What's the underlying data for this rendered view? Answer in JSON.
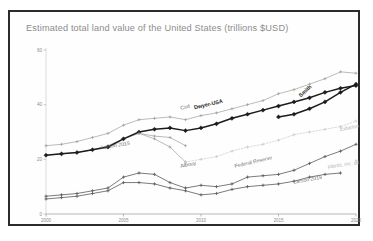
{
  "chart_data": {
    "type": "line",
    "title": "Estimated total land value of the United States (trillions $USD)",
    "xlabel": "",
    "ylabel": "",
    "xlim": [
      2000,
      2020
    ],
    "ylim": [
      0,
      60
    ],
    "xticks": [
      "2000",
      "2005",
      "2010",
      "2015",
      "2020"
    ],
    "yticks": [
      "0",
      "20",
      "40",
      "60"
    ],
    "grid": false,
    "legend_position": "inline-annotations",
    "series": [
      {
        "name": "Cird",
        "style": "thin-grey",
        "label_x": 2009,
        "label_y": 38.5,
        "x": [
          2000,
          2001,
          2002,
          2003,
          2004,
          2005,
          2006,
          2007,
          2008,
          2009,
          2010,
          2011,
          2012,
          2013,
          2014,
          2015,
          2016,
          2017,
          2018,
          2019,
          2020
        ],
        "values": [
          25,
          25.5,
          26.5,
          28,
          29.5,
          32.5,
          34.5,
          35,
          35.5,
          34.5,
          36,
          37,
          38.5,
          40,
          41.5,
          44,
          45.5,
          47.5,
          49.5,
          52,
          51.5
        ]
      },
      {
        "name": "Larson 2015",
        "style": "thin-grey",
        "label_x": 2004.5,
        "label_y": 24.5,
        "x": [
          2000,
          2001,
          2002,
          2003,
          2004,
          2005,
          2006,
          2007,
          2008,
          2009
        ],
        "values": [
          21.5,
          22,
          22.5,
          23.5,
          25,
          27.5,
          29.5,
          28.5,
          28,
          25
        ]
      },
      {
        "name": "Dwyer-USA",
        "style": "bold-black",
        "label_x": 2010.5,
        "label_y": 39.5,
        "x": [
          2000,
          2001,
          2002,
          2003,
          2004,
          2005,
          2006,
          2007,
          2008,
          2009,
          2010,
          2011,
          2012,
          2013,
          2014,
          2015,
          2016,
          2017,
          2018,
          2019,
          2020
        ],
        "values": [
          21.5,
          22,
          22.5,
          23.5,
          24.5,
          27.5,
          30,
          31,
          31.5,
          30.5,
          31.5,
          33,
          35,
          36.5,
          38,
          39.5,
          41,
          42.5,
          44.5,
          46,
          47
        ]
      },
      {
        "name": "Smith",
        "style": "bold-black",
        "label_x": 2016.8,
        "label_y": 44.5,
        "x": [
          2015,
          2016,
          2017,
          2018,
          2019,
          2020
        ],
        "values": [
          35.5,
          36.5,
          38.5,
          41,
          44.5,
          47.5
        ]
      },
      {
        "name": "Albouy",
        "style": "thin-grey",
        "label_x": 2009.2,
        "label_y": 17.5,
        "x": [
          2006,
          2007,
          2008,
          2009
        ],
        "values": [
          29.5,
          27.5,
          24.5,
          19
        ]
      },
      {
        "name": "Eidarton",
        "style": "dotted-faint",
        "label_x": 2019.6,
        "label_y": 31,
        "x": [
          2009,
          2010,
          2011,
          2012,
          2013,
          2014,
          2015,
          2016,
          2017,
          2018,
          2019,
          2020
        ],
        "values": [
          19,
          20,
          21,
          23,
          24.5,
          25.5,
          27,
          29,
          30,
          31,
          32,
          34
        ]
      },
      {
        "name": "Federal Reserve",
        "style": "thin-dark",
        "label_x": 2013.4,
        "label_y": 18.5,
        "x": [
          2000,
          2001,
          2002,
          2003,
          2004,
          2005,
          2006,
          2007,
          2008,
          2009,
          2010,
          2011,
          2012,
          2013,
          2014,
          2015,
          2016,
          2017,
          2018,
          2019,
          2020
        ],
        "values": [
          6.5,
          7,
          7.5,
          8.5,
          9.5,
          13.5,
          15,
          14.5,
          11.5,
          9.5,
          10.5,
          10,
          11,
          13.5,
          14,
          14.5,
          16,
          18.5,
          21,
          23,
          25.5
        ]
      },
      {
        "name": "Larson 2019",
        "style": "thin-dark",
        "label_x": 2016.9,
        "label_y": 12,
        "x": [
          2000,
          2001,
          2002,
          2003,
          2004,
          2005,
          2006,
          2007,
          2008,
          2009,
          2010,
          2011,
          2012,
          2013,
          2014,
          2015,
          2016,
          2017,
          2018,
          2019
        ],
        "values": [
          5.5,
          6,
          6.5,
          7.5,
          8.5,
          11.5,
          11.5,
          11,
          9.5,
          8.5,
          7,
          7.5,
          9,
          10,
          10.5,
          11,
          12,
          13.5,
          14.5,
          15
        ]
      },
      {
        "name": "plants, inc. all",
        "style": "faint-marker",
        "label_x": 2019.2,
        "label_y": 17.5,
        "x": [
          2020
        ],
        "values": [
          19.5
        ]
      }
    ]
  }
}
